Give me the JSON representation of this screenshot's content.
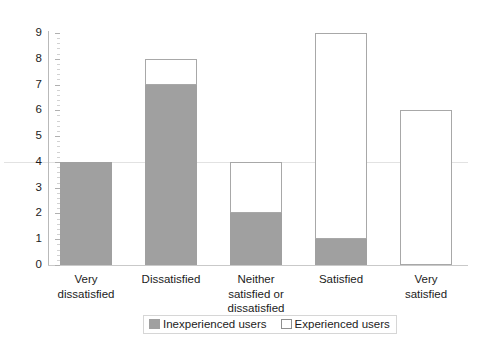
{
  "chart_data": {
    "type": "bar",
    "subtype": "stacked-bar",
    "title": "",
    "xlabel": "",
    "ylabel": "",
    "ylim": [
      0,
      9
    ],
    "y_ticks": [
      0,
      1,
      2,
      3,
      4,
      5,
      6,
      7,
      8,
      9
    ],
    "y_tick_labels": [
      "0",
      "1",
      "2",
      "3",
      "4",
      "5",
      "6",
      "7",
      "8",
      "9"
    ],
    "minor_tick_interval": 0.2,
    "grid": "single faint horizontal line at y=4",
    "legend_position": "bottom-center",
    "categories": [
      "Very dissatisfied",
      "Dissatisfied",
      "Neither satisfied or dissatisfied",
      "Satisfied",
      "Very satisfied"
    ],
    "category_label_lines": [
      [
        "Very",
        "dissatisfied"
      ],
      [
        "Dissatisfied"
      ],
      [
        "Neither",
        "satisfied or",
        "dissatisfied"
      ],
      [
        "Satisfied"
      ],
      [
        "Very",
        "satisfied"
      ]
    ],
    "series": [
      {
        "name": "Inexperienced users",
        "color": "#a0a0a0",
        "values": [
          4,
          7,
          2,
          1,
          0
        ]
      },
      {
        "name": "Experienced users",
        "color": "#ffffff",
        "border_color": "#a8a8a8",
        "values": [
          0,
          1,
          2,
          8,
          6
        ]
      }
    ],
    "stack_totals": [
      4,
      8,
      4,
      9,
      6
    ]
  },
  "legend": {
    "items": [
      {
        "label": "Inexperienced users",
        "swatch": "filled-gray-swatch"
      },
      {
        "label": "Experienced users",
        "swatch": "outlined-white-swatch"
      }
    ]
  },
  "colors": {
    "inexperienced": "#a0a0a0",
    "experienced_fill": "#ffffff",
    "experienced_border": "#a8a8a8",
    "axis": "#b9b9b9",
    "gridline": "#e2e2e2",
    "text": "#1c1c1c",
    "background": "#ffffff"
  }
}
